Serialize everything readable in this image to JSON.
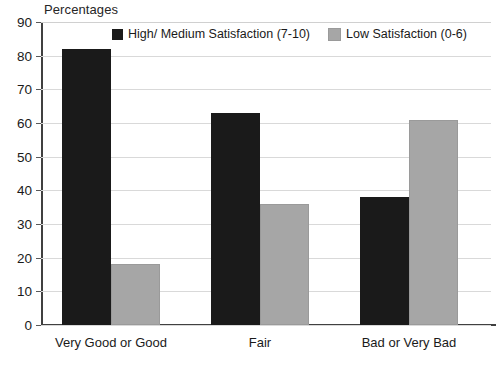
{
  "chart_data": {
    "type": "bar",
    "title": "Percentages",
    "xlabel": "",
    "ylabel": "",
    "ylim": [
      0,
      90
    ],
    "ytick_step": 10,
    "yticks": [
      "90",
      "80",
      "70",
      "60",
      "50",
      "40",
      "30",
      "20",
      "10",
      "0"
    ],
    "grid": true,
    "legend_position": "top-center",
    "categories": [
      "Very Good or Good",
      "Fair",
      "Bad or Very Bad"
    ],
    "series": [
      {
        "name": "High/ Medium Satisfaction (7-10)",
        "color": "#1a1a1a",
        "values": [
          82,
          63,
          38
        ]
      },
      {
        "name": "Low Satisfaction (0-6)",
        "color": "#a6a6a6",
        "values": [
          18,
          36,
          61
        ]
      }
    ]
  },
  "colors": {
    "series_dark": "#1a1a1a",
    "series_light": "#a6a6a6",
    "gridline": "#d9d9d9",
    "axis": "#404040",
    "background": "#ffffff",
    "text": "#1a1a1a"
  }
}
